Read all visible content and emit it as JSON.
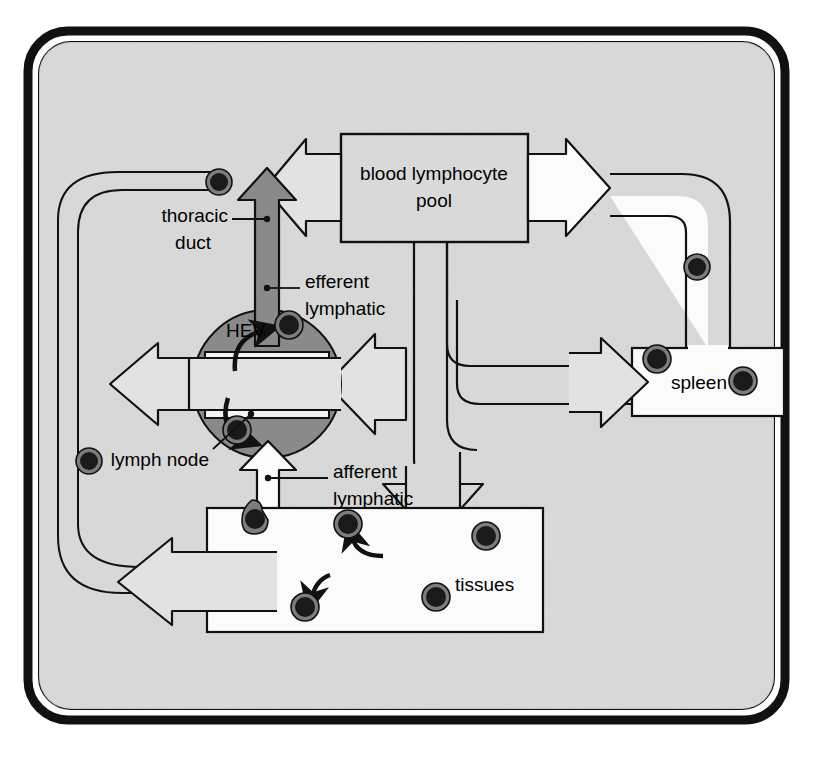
{
  "figure": {
    "background_color": "#ffffff",
    "canvas_color": "#d9d9d9",
    "frame_color": "#111111",
    "node_color": "#8a8a8a",
    "channel_fill": "#f4f4f4",
    "arrow_fill": "#e2e2e2",
    "lymphocyte_color": "#1a1a1a",
    "lymphocyte_ring_color": "#7d7d7d"
  },
  "labels": {
    "blood_pool_line1": "blood lymphocyte",
    "blood_pool_line2": "pool",
    "thoracic_duct_line1": "thoracic",
    "thoracic_duct_line2": "duct",
    "efferent_line1": "efferent",
    "efferent_line2": "lymphatic",
    "hev": "HEV",
    "lymph_node": "lymph node",
    "afferent_line1": "afferent",
    "afferent_line2": "lymphatic",
    "tissues": "tissues",
    "spleen": "spleen"
  },
  "organs": [
    {
      "name": "blood lymphocyte pool",
      "x": 341,
      "y": 134,
      "w": 187,
      "h": 108
    },
    {
      "name": "spleen",
      "x": 632,
      "y": 348,
      "w": 152,
      "h": 68
    },
    {
      "name": "tissues",
      "x": 207,
      "y": 508,
      "w": 336,
      "h": 124
    },
    {
      "name": "lymph node",
      "cx": 267,
      "cy": 384,
      "r": 74
    }
  ],
  "lymphocytes": [
    {
      "cx": 219,
      "cy": 182,
      "r": 13,
      "where": "thoracic-duct"
    },
    {
      "cx": 289,
      "cy": 325,
      "r": 14,
      "where": "lymph-node-upper"
    },
    {
      "cx": 237,
      "cy": 430,
      "r": 14,
      "where": "lymph-node-lower"
    },
    {
      "cx": 89,
      "cy": 461,
      "r": 13,
      "where": "left-return-channel"
    },
    {
      "cx": 697,
      "cy": 267,
      "r": 13,
      "where": "spleen-efferent"
    },
    {
      "cx": 657,
      "cy": 359,
      "r": 14,
      "where": "spleen-left"
    },
    {
      "cx": 743,
      "cy": 381,
      "r": 14,
      "where": "spleen-right"
    },
    {
      "cx": 257,
      "cy": 516,
      "r": 14,
      "where": "tissue-afferent-entry"
    },
    {
      "cx": 348,
      "cy": 524,
      "r": 14,
      "where": "tissue-upper-left"
    },
    {
      "cx": 486,
      "cy": 536,
      "r": 14,
      "where": "tissue-upper-right"
    },
    {
      "cx": 436,
      "cy": 597,
      "r": 14,
      "where": "tissue-lower-right"
    },
    {
      "cx": 305,
      "cy": 607,
      "r": 14,
      "where": "tissue-lower-left"
    }
  ],
  "flows": [
    {
      "name": "thoracic-duct-into-blood-pool",
      "direction": "right"
    },
    {
      "name": "spleen-into-blood-pool",
      "direction": "left"
    },
    {
      "name": "blood-pool-into-tissues",
      "direction": "down"
    },
    {
      "name": "blood-pool-into-lymph-node",
      "direction": "left"
    },
    {
      "name": "efferent-lymphatic-out-of-node",
      "direction": "up"
    },
    {
      "name": "afferent-lymphatic-into-node",
      "direction": "up"
    },
    {
      "name": "node-recirculation-left",
      "direction": "left"
    },
    {
      "name": "tissue-recirculation-left",
      "direction": "left"
    }
  ]
}
